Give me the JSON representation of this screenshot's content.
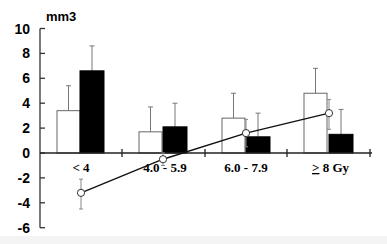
{
  "chart_data": {
    "type": "bar",
    "title": "",
    "ylabel": "mm3",
    "xlabel": "Gy",
    "ylim": [
      -6,
      10
    ],
    "yticks": [
      10,
      8,
      6,
      4,
      2,
      0,
      -2,
      -4,
      -6
    ],
    "grid": false,
    "legend": null,
    "categories": [
      "< 4",
      "4.0 - 5.9",
      "6.0 - 7.9",
      "≥ 8"
    ],
    "category_unit": "Gy",
    "series": [
      {
        "name": "white bars",
        "kind": "bar",
        "fill": "#ffffff",
        "values": [
          3.4,
          1.7,
          2.8,
          4.8
        ],
        "error_upper": [
          5.4,
          3.7,
          4.8,
          6.8
        ]
      },
      {
        "name": "black bars",
        "kind": "bar",
        "fill": "#000000",
        "values": [
          6.6,
          2.1,
          1.3,
          1.5
        ],
        "error_upper": [
          8.6,
          4.0,
          3.2,
          3.5
        ]
      },
      {
        "name": "line (open circles)",
        "kind": "line",
        "values": [
          -3.2,
          -0.5,
          1.6,
          3.2
        ],
        "error_low": [
          -4.5,
          -1.0,
          0.5,
          1.9
        ],
        "error_high": [
          -2.1,
          0.0,
          2.7,
          4.3
        ]
      }
    ]
  }
}
